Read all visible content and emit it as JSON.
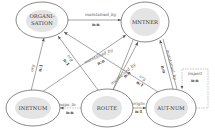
{
  "diagram": {
    "nodes": [
      {
        "id": "organisation",
        "label_line1": "ORGANI-",
        "label_line2": "SATION"
      },
      {
        "id": "mntner",
        "label": "MNTNER"
      },
      {
        "id": "inetnum",
        "label": "INETNUM"
      },
      {
        "id": "route",
        "label": "ROUTE"
      },
      {
        "id": "autnum",
        "label": "AUT-NUM"
      }
    ],
    "edges": [
      {
        "from": "ORGANISATION",
        "to": "MNTNER",
        "label": "maintained_by",
        "cardinality": "n:n"
      },
      {
        "from": "INETNUM",
        "to": "ORGANISATION",
        "label": "org",
        "cardinality": "n:1"
      },
      {
        "from": "ROUTE",
        "to": "ORGANISATION",
        "label": "org",
        "cardinality": "n:1"
      },
      {
        "from": "INETNUM",
        "to": "MNTNER",
        "label": "maintained_by",
        "cardinality": "n:n"
      },
      {
        "from": "ROUTE",
        "to": "MNTNER",
        "label": "maintained_by",
        "cardinality": "n:n"
      },
      {
        "from": "AUT-NUM",
        "to": "ORGANISATION",
        "label": "org",
        "cardinality": "n:1"
      },
      {
        "from": "AUT-NUM",
        "to": "MNTNER",
        "label": "maintained_by",
        "cardinality": "n:n"
      },
      {
        "from": "ROUTE",
        "to": "INETNUM",
        "label": "maps_to",
        "cardinality": "n:n"
      },
      {
        "from": "ROUTE",
        "to": "AUT-NUM",
        "label": "origin",
        "cardinality": "n:1"
      },
      {
        "from": "AUT-NUM",
        "to": "AUT-NUM",
        "label": "import",
        "cardinality": "n:n"
      }
    ]
  }
}
